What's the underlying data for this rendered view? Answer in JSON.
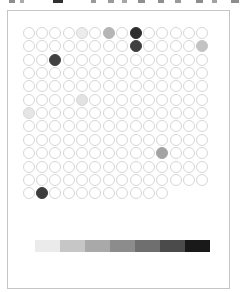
{
  "style": {
    "background": "#ffffff",
    "frame_border": "#c5c5c5",
    "dot_outline": "#d7d7d7"
  },
  "header": {
    "note": "text line clipped at top edge of screenshot; only glyph bottoms visible",
    "fragments": [
      {
        "x": 9,
        "w": 6,
        "c": "#8d8d8d"
      },
      {
        "x": 20,
        "w": 4,
        "c": "#ababab"
      },
      {
        "x": 53,
        "w": 10,
        "c": "#303030"
      },
      {
        "x": 91,
        "w": 5,
        "c": "#9a9a9a"
      },
      {
        "x": 108,
        "w": 6,
        "c": "#9a9a9a"
      },
      {
        "x": 122,
        "w": 5,
        "c": "#a6a6a6"
      },
      {
        "x": 138,
        "w": 7,
        "c": "#8f8f8f"
      },
      {
        "x": 158,
        "w": 6,
        "c": "#8f8f8f"
      },
      {
        "x": 175,
        "w": 6,
        "c": "#9a9a9a"
      },
      {
        "x": 196,
        "w": 7,
        "c": "#8d8d8d"
      },
      {
        "x": 212,
        "w": 5,
        "c": "#a2a2a2"
      },
      {
        "x": 231,
        "w": 8,
        "c": "#8d8d8d"
      }
    ]
  },
  "chart_data": {
    "type": "heatmap",
    "title": "",
    "grid": {
      "rows": 13,
      "cols": 14,
      "last_row_cols": 11,
      "empty_value": 0
    },
    "points": [
      {
        "row": 1,
        "col": 5,
        "value": 0.08,
        "color": "#ececec"
      },
      {
        "row": 1,
        "col": 7,
        "value": 0.3,
        "color": "#b5b5b5"
      },
      {
        "row": 1,
        "col": 9,
        "value": 0.85,
        "color": "#2e2e2e"
      },
      {
        "row": 2,
        "col": 9,
        "value": 0.78,
        "color": "#3f3f3f"
      },
      {
        "row": 2,
        "col": 14,
        "value": 0.25,
        "color": "#c3c3c3"
      },
      {
        "row": 3,
        "col": 3,
        "value": 0.76,
        "color": "#414141"
      },
      {
        "row": 6,
        "col": 5,
        "value": 0.12,
        "color": "#e2e2e2"
      },
      {
        "row": 7,
        "col": 1,
        "value": 0.1,
        "color": "#e6e6e6"
      },
      {
        "row": 10,
        "col": 11,
        "value": 0.38,
        "color": "#a3a3a3"
      },
      {
        "row": 13,
        "col": 2,
        "value": 0.77,
        "color": "#3c3c3c"
      }
    ],
    "legend": {
      "position": "bottom",
      "scale": "light-to-dark",
      "colors": [
        "#ebebeb",
        "#c6c6c6",
        "#a9a9a9",
        "#8c8c8c",
        "#6f6f6f",
        "#4b4b4b",
        "#191919"
      ]
    }
  }
}
